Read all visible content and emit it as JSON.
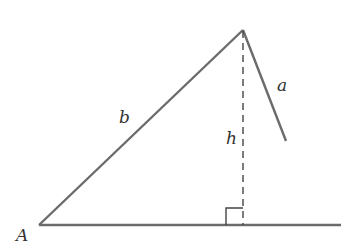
{
  "diagram": {
    "type": "triangle-altitude",
    "colors": {
      "stroke": "#6b6b6b",
      "dashed": "#444444",
      "label": "#333333",
      "background": "#ffffff"
    },
    "labels": {
      "vertex_A": "A",
      "side_a": "a",
      "side_b": "b",
      "height": "h"
    },
    "elements": {
      "base": "horizontal base line from vertex A",
      "side_b": "side from A to apex",
      "side_a": "side from apex (partial, not reaching base)",
      "altitude": "dashed perpendicular from apex to base",
      "right_angle_marker": "square at foot of altitude"
    }
  }
}
